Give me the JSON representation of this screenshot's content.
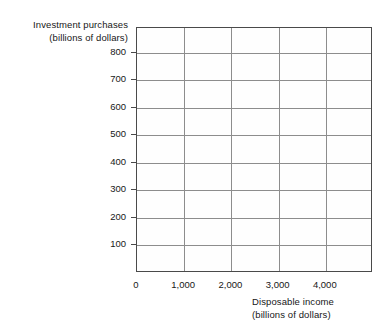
{
  "chart_data": {
    "type": "scatter",
    "title": "",
    "subtitle": "",
    "ylabel_lines": [
      "Investment purchases",
      "(billions of dollars)"
    ],
    "xlabel_lines": [
      "Disposable income",
      "(billions of dollars)"
    ],
    "ylabel": "Investment purchases (billions of dollars)",
    "xlabel": "Disposable income (billions of dollars)",
    "x_ticks": [
      0,
      1000,
      2000,
      3000,
      4000
    ],
    "x_tick_labels": [
      "0",
      "1,000",
      "2,000",
      "3,000",
      "4,000"
    ],
    "y_ticks": [
      100,
      200,
      300,
      400,
      500,
      600,
      700,
      800
    ],
    "y_tick_labels": [
      "100",
      "200",
      "300",
      "400",
      "500",
      "600",
      "700",
      "800"
    ],
    "xlim": [
      0,
      5000
    ],
    "ylim": [
      0,
      890
    ],
    "grid": true,
    "grid_color": "#8d8d8d",
    "frame_color": "#4a4a4a",
    "background": "#fefefe",
    "legend": null,
    "legend_position": "none",
    "series": [],
    "values": [],
    "annotations": [],
    "note": "Empty grid / blank graph template with no plotted data"
  }
}
